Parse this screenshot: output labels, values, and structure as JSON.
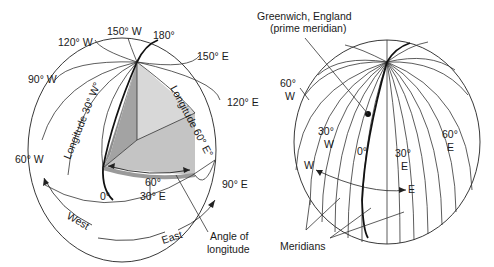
{
  "left_globe": {
    "labels": {
      "w150": "150° W",
      "e180": "180°",
      "w120": "120° W",
      "e150": "150° E",
      "w90": "90° W",
      "e120": "120° E",
      "w60": "60° W",
      "e90": "90° E",
      "zero": "0°",
      "e30": "30° E",
      "angle_value": "60°",
      "lon30w": "Longitude 30° W°",
      "lon60e": "Longitude 60° E°",
      "west": "West",
      "east": "East",
      "angle_of": "Angle of",
      "longitude": "longitude"
    },
    "colors": {
      "dark_wedge": "#8e8e8e",
      "light_wedge": "#cfcfcf",
      "mid_wedge": "#b5b5b5"
    }
  },
  "right_globe": {
    "labels": {
      "greenwich": "Greenwich, England",
      "prime": "(prime meridian)",
      "w60_num": "60°",
      "w60_dir": "W",
      "w30_num": "30°",
      "w30_dir": "W",
      "zero": "0°",
      "e30_num": "30°",
      "e30_dir": "E",
      "e60_num": "60°",
      "e60_dir": "E",
      "w": "W",
      "e": "E",
      "meridians": "Meridians"
    }
  }
}
